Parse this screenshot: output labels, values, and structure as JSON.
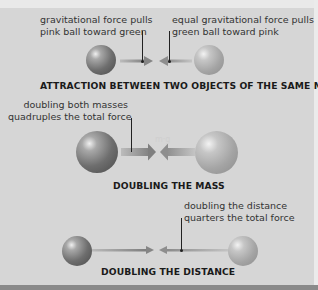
{
  "sections": [
    {
      "title": "ATTRACTION BETWEEN TWO OBJECTS OF THE SAME MASS",
      "label_left": [
        "gravitational force pulls",
        "pink ball toward green"
      ],
      "label_right": [
        "equal gravitational force pulls",
        "green ball toward pink"
      ]
    },
    {
      "title": "DOUBLING THE MASS",
      "label_left": [
        "doubling both masses",
        "quadruples the total force"
      ],
      "faint_text": "m·g"
    },
    {
      "title": "DOUBLING THE DISTANCE",
      "label_right": [
        "doubling the distance",
        "quarters the total force"
      ]
    }
  ],
  "colors": {
    "background": "#d6d6d6",
    "pink_ball": "#6e6e6e",
    "green_ball": "#a4a4a4",
    "arrow": "#8a8a8a",
    "text": "#333333",
    "bottom_bar": "#8a8a8a"
  }
}
